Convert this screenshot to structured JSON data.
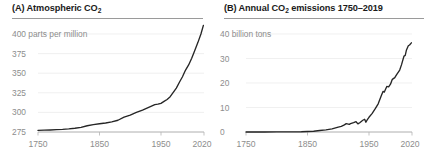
{
  "figure": {
    "background": "#ffffff",
    "line_color": "#262626",
    "grid_color": "#e9e9e9",
    "label_color": "#8d8d8d",
    "title_color": "#1b1b1b"
  },
  "panels": [
    {
      "id": "panel-a",
      "label": "(A)",
      "title_prefix": "(A) Atmospheric CO",
      "title_sub": "2",
      "title_suffix": "",
      "title_full": "(A) Atmospheric CO₂"
    },
    {
      "id": "panel-b",
      "label": "(B)",
      "title_prefix": "(B) Annual CO",
      "title_sub": "2",
      "title_suffix": " emissions 1750–2019",
      "title_full": "(B) Annual CO₂ emissions 1750–2019"
    }
  ],
  "chart_data": [
    {
      "type": "line",
      "title": "(A) Atmospheric CO₂",
      "xlabel": "",
      "ylabel": "parts per million",
      "unit_label": "400 parts per million",
      "grid": true,
      "legend": "none",
      "xlim": [
        1750,
        2020
      ],
      "ylim": [
        270,
        412
      ],
      "xticks": [
        1750,
        1850,
        1950,
        2020
      ],
      "xtick_labels": [
        "1750",
        "1850",
        "1950",
        "2020"
      ],
      "yticks": [
        275,
        300,
        325,
        350,
        375,
        400
      ],
      "ytick_labels": [
        "275",
        "300",
        "325",
        "350",
        "375",
        "400 parts per million"
      ],
      "x": [
        1750,
        1760,
        1770,
        1780,
        1790,
        1800,
        1810,
        1820,
        1830,
        1840,
        1850,
        1860,
        1870,
        1880,
        1890,
        1900,
        1910,
        1920,
        1930,
        1940,
        1945,
        1950,
        1955,
        1960,
        1965,
        1970,
        1975,
        1980,
        1985,
        1990,
        1995,
        2000,
        2005,
        2010,
        2015,
        2019
      ],
      "y": [
        277,
        277.3,
        277.6,
        278,
        278.4,
        279,
        279.8,
        281,
        283,
        284.5,
        285.5,
        286.5,
        288,
        290,
        294,
        296.5,
        300,
        303,
        306.5,
        310,
        310.5,
        311.5,
        314,
        316.5,
        320,
        325.5,
        331,
        338.5,
        345.5,
        354,
        360.5,
        369,
        379,
        389,
        400,
        411
      ]
    },
    {
      "type": "line",
      "title": "(B) Annual CO₂ emissions 1750–2019",
      "xlabel": "",
      "ylabel": "billion tons",
      "unit_label": "40 billion tons",
      "grid": true,
      "legend": "none",
      "xlim": [
        1750,
        2020
      ],
      "ylim": [
        0,
        42
      ],
      "xticks": [
        1750,
        1850,
        1950,
        2020
      ],
      "xtick_labels": [
        "1750",
        "1850",
        "1950",
        "2020"
      ],
      "yticks": [
        0,
        10,
        20,
        30,
        40
      ],
      "ytick_labels": [
        "0",
        "10",
        "20",
        "30",
        "40 billion tons"
      ],
      "x": [
        1750,
        1780,
        1800,
        1820,
        1840,
        1850,
        1860,
        1870,
        1880,
        1890,
        1900,
        1905,
        1910,
        1913,
        1918,
        1920,
        1925,
        1929,
        1932,
        1935,
        1938,
        1940,
        1943,
        1945,
        1948,
        1950,
        1955,
        1960,
        1965,
        1970,
        1973,
        1975,
        1979,
        1982,
        1985,
        1988,
        1992,
        1995,
        2000,
        2003,
        2007,
        2009,
        2011,
        2014,
        2016,
        2019
      ],
      "y": [
        0.01,
        0.02,
        0.03,
        0.05,
        0.11,
        0.2,
        0.3,
        0.6,
        0.9,
        1.3,
        2.0,
        2.3,
        2.9,
        3.4,
        3.1,
        3.4,
        3.8,
        4.2,
        3.3,
        3.8,
        4.4,
        4.8,
        5.2,
        4.0,
        5.3,
        6.0,
        7.5,
        9.4,
        11.5,
        14.8,
        16.6,
        16.3,
        18.6,
        18.4,
        19.5,
        21.5,
        22.2,
        23.4,
        25.3,
        27.5,
        31.0,
        31.3,
        33.5,
        35.2,
        35.5,
        36.4
      ]
    }
  ]
}
